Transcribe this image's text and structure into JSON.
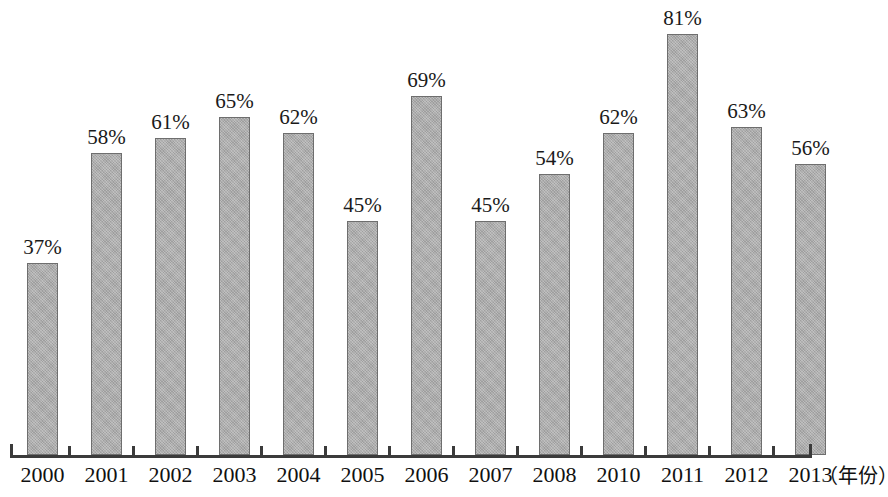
{
  "chart_data": {
    "type": "bar",
    "title": "",
    "subtitle": "",
    "xlabel": "（年份）",
    "ylabel": "",
    "grid": false,
    "legend": null,
    "ylim": [
      0,
      81
    ],
    "axis_range_note": "no y-axis drawn; bar heights proportional to value",
    "categories": [
      "2000",
      "2001",
      "2002",
      "2003",
      "2004",
      "2005",
      "2006",
      "2007",
      "2008",
      "2010",
      "2011",
      "2012",
      "2013"
    ],
    "values": [
      37,
      58,
      61,
      65,
      62,
      45,
      69,
      45,
      54,
      62,
      81,
      63,
      56
    ],
    "value_labels": [
      "37%",
      "58%",
      "61%",
      "65%",
      "62%",
      "45%",
      "69%",
      "45%",
      "54%",
      "62%",
      "81%",
      "63%",
      "56%"
    ],
    "unit": "%"
  },
  "axis": {
    "caption": "（年份）"
  },
  "bars": [
    {
      "year": "2000",
      "value": 37,
      "label": "37%"
    },
    {
      "year": "2001",
      "value": 58,
      "label": "58%"
    },
    {
      "year": "2002",
      "value": 61,
      "label": "61%"
    },
    {
      "year": "2003",
      "value": 65,
      "label": "65%"
    },
    {
      "year": "2004",
      "value": 62,
      "label": "62%"
    },
    {
      "year": "2005",
      "value": 45,
      "label": "45%"
    },
    {
      "year": "2006",
      "value": 69,
      "label": "69%"
    },
    {
      "year": "2007",
      "value": 45,
      "label": "45%"
    },
    {
      "year": "2008",
      "value": 54,
      "label": "54%"
    },
    {
      "year": "2010",
      "value": 62,
      "label": "62%"
    },
    {
      "year": "2011",
      "value": 81,
      "label": "81%"
    },
    {
      "year": "2012",
      "value": 63,
      "label": "63%"
    },
    {
      "year": "2013",
      "value": 56,
      "label": "56%"
    }
  ],
  "style": {
    "bar_fill": "#adadad",
    "bar_border": "#6e6e6e",
    "axis_color": "#3b3b3b",
    "text_color": "#111111",
    "background": "#ffffff"
  },
  "geometry": {
    "baseline_y": 455,
    "axis_left_x": 10,
    "axis_right_x": 812,
    "first_bar_left_x": 27,
    "bar_width": 31,
    "bar_pitch": 64,
    "px_per_percent": 5.2
  }
}
